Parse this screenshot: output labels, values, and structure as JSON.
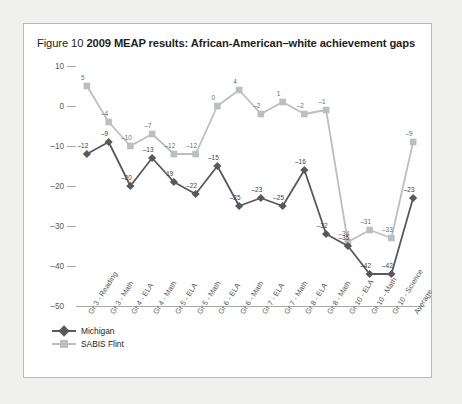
{
  "figure": {
    "number": "Figure 10",
    "title": "2009 MEAP results: African-American–white achievement gaps"
  },
  "colors": {
    "michigan": "#58595b",
    "sabis": "#bcbec0",
    "axis": "#a7a9ac",
    "panel_border": "#b9b9b9",
    "page_background": "#f0f0ee",
    "panel_background": "#ffffff",
    "text": "#231f20"
  },
  "legend": {
    "position": "bottom-left",
    "entries": [
      {
        "label": "Michigan",
        "marker": "diamond",
        "color": "#58595b"
      },
      {
        "label": "SABIS Flint",
        "marker": "square",
        "color": "#bcbec0"
      }
    ]
  },
  "chart_data": {
    "type": "line",
    "title": "2009 MEAP results: African-American–white achievement gaps",
    "xlabel": "",
    "ylabel": "",
    "ylim": [
      -50,
      10
    ],
    "yticks": [
      10,
      0,
      -10,
      -20,
      -30,
      -40,
      -50
    ],
    "ytick_labels": [
      "10",
      "0",
      "–10",
      "–20",
      "–30",
      "–40",
      "–50"
    ],
    "grid": false,
    "legend_position": "bottom-left",
    "categories": [
      "Gr 3 - Reading",
      "Gr 3 - Math",
      "Gr 4 - ELA",
      "Gr 4 - Math",
      "Gr 5 - ELA",
      "Gr 5 - Math",
      "Gr 6 - ELA",
      "Gr 6 - Math",
      "Gr 7 - ELA",
      "Gr 7 - Math",
      "Gr 8 - ELA",
      "Gr 8 - Math",
      "Gr 10 - ELA",
      "Gr 10 - Math",
      "Gr 10 - Science",
      "Average"
    ],
    "series": [
      {
        "name": "Michigan",
        "color": "#58595b",
        "marker": "diamond",
        "values": [
          -12,
          -9,
          -20,
          -13,
          -19,
          -22,
          -15,
          -25,
          -23,
          -25,
          -16,
          -32,
          -35,
          -42,
          -42,
          -23
        ],
        "labels": [
          "–12",
          "–9",
          "–20",
          "–13",
          "19",
          "–22",
          "–15",
          "–25",
          "–23",
          "–25",
          "–16",
          "–32",
          "–35",
          "–42",
          "–42",
          "–23"
        ]
      },
      {
        "name": "SABIS Flint",
        "color": "#bcbec0",
        "marker": "square",
        "values": [
          5,
          -4,
          -10,
          -7,
          -12,
          -12,
          0,
          4,
          -2,
          1,
          -2,
          -1,
          -34,
          -31,
          -33,
          -9
        ],
        "labels": [
          "5",
          "–4",
          "–10",
          "–7",
          "–12",
          "–12",
          "0",
          "4",
          "–2",
          "1",
          "–2",
          "–1",
          "–34",
          "–31",
          "–33",
          "–9"
        ]
      }
    ]
  }
}
